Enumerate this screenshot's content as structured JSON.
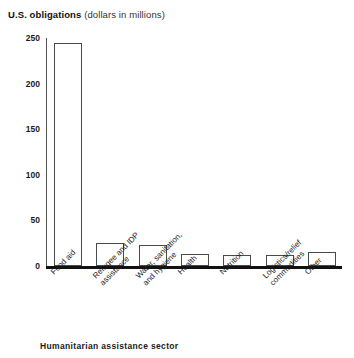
{
  "chart_data": {
    "type": "bar",
    "title": "U.S. obligations (dollars in millions)",
    "title_strong": "U.S. obligations",
    "title_sub": "(dollars in millions)",
    "xlabel": "Humanitarian assistance sector",
    "ylabel": "U.S. obligations (dollars in millions)",
    "ylim": [
      0,
      250
    ],
    "yticks": [
      250,
      200,
      150,
      100,
      50,
      0
    ],
    "ytick_labels": [
      "250",
      "200",
      "150",
      "100",
      "50",
      "0"
    ],
    "grid": false,
    "legend": false,
    "categories": [
      "Food aid",
      "Refugee and IDP assistance",
      "Water, sanitation, and hygiene",
      "Health",
      "Nutrition",
      "Logistics/relief commodities",
      "Other"
    ],
    "category_lines": [
      [
        "Food aid",
        ""
      ],
      [
        "Refugee and IDP",
        "assistance"
      ],
      [
        "Water, sanitation,",
        "and hygiene"
      ],
      [
        "Health",
        ""
      ],
      [
        "Nutrition",
        ""
      ],
      [
        "Logistics/relief",
        "commodities"
      ],
      [
        "Other",
        ""
      ]
    ],
    "values": [
      245,
      25,
      23,
      13,
      12,
      12,
      15
    ],
    "bar_fill": "#ffffff",
    "bar_edge": "#4a4a4a",
    "axis_color": "#111111",
    "background": "#ffffff"
  }
}
